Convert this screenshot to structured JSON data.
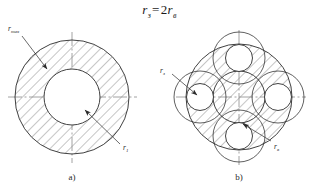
{
  "figure": {
    "formula": {
      "lhs_symbol": "r",
      "lhs_subscript": "з",
      "equals": "=",
      "coefficient": "2",
      "rhs_symbol": "r",
      "rhs_subscript": "в",
      "full_text": "rз = 2rв"
    },
    "captions": {
      "a": "a)",
      "b": "b)"
    },
    "colors": {
      "stroke": "#2b2b2b",
      "hatch": "#5a5a5a",
      "axis": "#8a8a8a",
      "text": "#2a2a2a",
      "background": "#ffffff"
    }
  },
  "diagram_a": {
    "label": "a)",
    "annotations": [
      {
        "id": "r-max",
        "symbol": "r",
        "subscript": "max",
        "text": "rmax",
        "target": "outer-circle"
      },
      {
        "id": "r-1",
        "symbol": "r",
        "subscript": "1",
        "text": "r1",
        "target": "inner-circle"
      }
    ],
    "geometry": {
      "center_x": 72,
      "center_y": 97,
      "outer_radius": 57,
      "inner_radius": 28,
      "hatched_region": "annulus"
    }
  },
  "diagram_b": {
    "label": "b)",
    "annotations": [
      {
        "id": "r-z",
        "symbol": "r",
        "subscript": "з",
        "text": "rз",
        "target": "west-small-circle"
      },
      {
        "id": "r-v",
        "symbol": "r",
        "subscript": "в",
        "text": "rв",
        "target": "south-small-circle"
      }
    ],
    "geometry": {
      "center_x": 239,
      "center_y": 97,
      "outer_radius": 53,
      "core_radius": 26,
      "small_circle_radius": 13.5,
      "small_circle_orbit": 39,
      "small_circle_count": 4,
      "small_circle_positions": [
        "north",
        "east",
        "south",
        "west"
      ],
      "hatched_region": "outer-ring-and-core"
    }
  }
}
